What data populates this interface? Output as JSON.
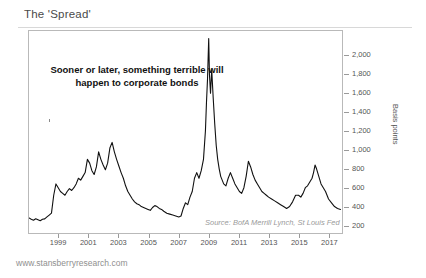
{
  "header": {
    "title": "The 'Spread'"
  },
  "footer": {
    "url": "www.stansberryresearch.com"
  },
  "annotation": {
    "text": "Sooner or later, something terrible will happen to corporate bonds"
  },
  "source": {
    "text": "Source: BofA Merrill Lynch, St Louis Fed"
  },
  "colors": {
    "line": "#111111",
    "frame": "#b9b9b9",
    "axis_text": "#555555",
    "title_text": "#4a4a4a",
    "source_text": "#9a9a9a"
  },
  "chart_data": {
    "type": "line",
    "title": "The 'Spread'",
    "subtitle": "",
    "xlabel": "",
    "ylabel": "Basis points",
    "grid": false,
    "legend": null,
    "annotations": [
      "Sooner or later, something terrible will happen to corporate bonds",
      "Source: BofA Merrill Lynch, St Louis Fed"
    ],
    "xlim": [
      1997.0,
      2017.9
    ],
    "ylim": [
      120,
      2260
    ],
    "xticks": [
      1999,
      2001,
      2003,
      2005,
      2007,
      2009,
      2011,
      2013,
      2015,
      2017
    ],
    "xtick_labels": [
      "1999",
      "2001",
      "2003",
      "2005",
      "2007",
      "2009",
      "2011",
      "2013",
      "2015",
      "2017"
    ],
    "yticks": [
      200,
      400,
      600,
      800,
      1000,
      1200,
      1400,
      1600,
      1800,
      2000
    ],
    "ytick_labels": [
      "200",
      "400",
      "600",
      "800",
      "1,000",
      "1,200",
      "1,400",
      "1,600",
      "1,800",
      "2,000"
    ],
    "series": [
      {
        "name": "US High Yield Option-Adjusted Spread",
        "x": [
          1997.0,
          1997.15,
          1997.3,
          1997.45,
          1997.6,
          1997.75,
          1997.9,
          1998.05,
          1998.2,
          1998.35,
          1998.5,
          1998.65,
          1998.8,
          1998.95,
          1999.1,
          1999.25,
          1999.4,
          1999.55,
          1999.7,
          1999.85,
          2000.0,
          2000.15,
          2000.3,
          2000.45,
          2000.6,
          2000.75,
          2000.9,
          2001.05,
          2001.2,
          2001.35,
          2001.5,
          2001.65,
          2001.8,
          2001.95,
          2002.1,
          2002.25,
          2002.4,
          2002.55,
          2002.7,
          2002.85,
          2003.0,
          2003.15,
          2003.3,
          2003.45,
          2003.6,
          2003.75,
          2003.9,
          2004.05,
          2004.2,
          2004.35,
          2004.5,
          2004.65,
          2004.8,
          2004.95,
          2005.1,
          2005.25,
          2005.4,
          2005.55,
          2005.7,
          2005.85,
          2006.0,
          2006.2,
          2006.4,
          2006.6,
          2006.8,
          2007.0,
          2007.15,
          2007.3,
          2007.45,
          2007.6,
          2007.75,
          2007.9,
          2008.05,
          2008.2,
          2008.35,
          2008.5,
          2008.65,
          2008.78,
          2008.85,
          2008.92,
          2009.0,
          2009.05,
          2009.12,
          2009.2,
          2009.3,
          2009.4,
          2009.5,
          2009.6,
          2009.7,
          2009.8,
          2009.9,
          2010.0,
          2010.15,
          2010.3,
          2010.45,
          2010.6,
          2010.75,
          2010.9,
          2011.05,
          2011.2,
          2011.35,
          2011.5,
          2011.65,
          2011.8,
          2011.95,
          2012.1,
          2012.25,
          2012.4,
          2012.55,
          2012.7,
          2012.85,
          2013.0,
          2013.2,
          2013.4,
          2013.6,
          2013.8,
          2014.0,
          2014.2,
          2014.4,
          2014.6,
          2014.8,
          2015.0,
          2015.15,
          2015.3,
          2015.45,
          2015.6,
          2015.75,
          2015.9,
          2016.0,
          2016.1,
          2016.2,
          2016.35,
          2016.5,
          2016.65,
          2016.8,
          2017.0,
          2017.2,
          2017.4,
          2017.6,
          2017.8
        ],
        "y": [
          280,
          265,
          255,
          270,
          260,
          250,
          265,
          270,
          290,
          310,
          330,
          520,
          640,
          600,
          560,
          540,
          520,
          560,
          590,
          570,
          600,
          640,
          700,
          680,
          720,
          760,
          900,
          860,
          780,
          740,
          820,
          980,
          900,
          840,
          790,
          860,
          1020,
          1080,
          980,
          900,
          830,
          760,
          700,
          620,
          560,
          520,
          480,
          450,
          430,
          420,
          400,
          390,
          380,
          370,
          360,
          390,
          410,
          400,
          380,
          370,
          350,
          330,
          320,
          310,
          300,
          290,
          300,
          380,
          440,
          420,
          500,
          560,
          700,
          760,
          700,
          780,
          900,
          1200,
          1500,
          1750,
          2180,
          1800,
          1600,
          1850,
          1550,
          1280,
          1050,
          900,
          800,
          720,
          680,
          640,
          620,
          700,
          760,
          700,
          640,
          600,
          560,
          540,
          600,
          720,
          880,
          820,
          740,
          680,
          640,
          600,
          560,
          540,
          520,
          500,
          480,
          460,
          440,
          420,
          400,
          380,
          400,
          450,
          520,
          520,
          500,
          540,
          600,
          620,
          660,
          700,
          760,
          840,
          800,
          720,
          640,
          600,
          560,
          480,
          440,
          400,
          380,
          370
        ]
      }
    ]
  }
}
